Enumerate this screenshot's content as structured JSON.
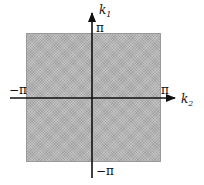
{
  "diagram": {
    "title": "",
    "region": {
      "shape": "square",
      "fill": "#b4b4b4",
      "pattern": "stippled"
    },
    "axes": {
      "horizontal": {
        "name": "k",
        "subscript": "2",
        "min_label": "−π",
        "max_label": "π"
      },
      "vertical": {
        "name": "k",
        "subscript": "1",
        "min_label": "−π",
        "max_label": "π"
      }
    },
    "colors": {
      "axis": "#111111",
      "region": "#b4b4b4",
      "background": "#ffffff"
    }
  }
}
